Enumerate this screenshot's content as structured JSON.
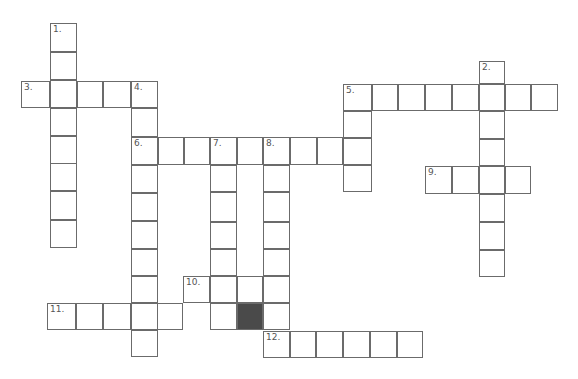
{
  "puzzle": {
    "type": "crossword",
    "cell_size": 27,
    "line_color": "#6b6b6b",
    "shaded_color": "#4a4a4a",
    "clue_numbers": [
      "1.",
      "2.",
      "3.",
      "4.",
      "5.",
      "6.",
      "7.",
      "8.",
      "9.",
      "10.",
      "11.",
      "12."
    ],
    "entries": [
      {
        "number": "1",
        "direction": "down",
        "length": 8
      },
      {
        "number": "2",
        "direction": "down",
        "length": 8
      },
      {
        "number": "3",
        "direction": "across",
        "length": 5
      },
      {
        "number": "4",
        "direction": "down",
        "length": 10
      },
      {
        "number": "5",
        "direction": "across",
        "length": 8
      },
      {
        "number": "5",
        "direction": "down",
        "length": 4
      },
      {
        "number": "6",
        "direction": "across",
        "length": 9
      },
      {
        "number": "7",
        "direction": "down",
        "length": 7
      },
      {
        "number": "8",
        "direction": "down",
        "length": 7
      },
      {
        "number": "9",
        "direction": "across",
        "length": 4
      },
      {
        "number": "10",
        "direction": "across",
        "length": 4
      },
      {
        "number": "11",
        "direction": "across",
        "length": 5
      },
      {
        "number": "12",
        "direction": "across",
        "length": 6
      }
    ]
  }
}
